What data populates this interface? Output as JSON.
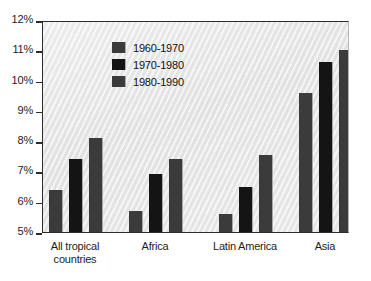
{
  "chart_data": {
    "type": "bar",
    "title": "",
    "subtitle": "",
    "xlabel": "",
    "ylabel": "",
    "categories": [
      "All tropical\ncountries",
      "Africa",
      "Latin America",
      "Asia"
    ],
    "series": [
      {
        "name": "1960-1970",
        "color": "#3b3b3b",
        "values": [
          6.4,
          5.7,
          5.6,
          9.6
        ]
      },
      {
        "name": "1970-1980",
        "color": "#141414",
        "values": [
          7.4,
          6.9,
          6.5,
          10.6
        ]
      },
      {
        "name": "1980-1990",
        "color": "#3b3b3b",
        "values": [
          8.1,
          7.4,
          7.55,
          11.0
        ]
      }
    ],
    "ylim": [
      5,
      12
    ],
    "ytick_values": [
      12,
      11,
      10,
      9,
      8,
      7,
      6,
      5
    ],
    "ytick_labels": [
      "12%",
      "11%",
      "10%",
      "9%",
      "8%",
      "7%",
      "6%",
      "5%"
    ],
    "grid": false,
    "legend_position": "upper-left-inside",
    "plot_background": "#e9e9e9",
    "axis_color": "#2c2c2c",
    "text_color": "#1d1d1d"
  }
}
